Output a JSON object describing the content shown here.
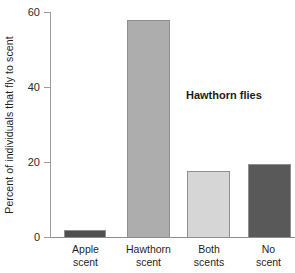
{
  "chart_data": {
    "type": "bar",
    "title": "",
    "subtitle": "",
    "xlabel": "",
    "ylabel": "Percent of individuals that fly to scent",
    "ylim": [
      0,
      60
    ],
    "yticks": [
      0,
      20,
      40,
      60
    ],
    "ytick_labels": [
      "0",
      "20",
      "40",
      "60"
    ],
    "grid": false,
    "legend": null,
    "annotations": [
      {
        "text": "Hawthorn flies",
        "bold": true
      }
    ],
    "categories": [
      "Apple\nscent",
      "Hawthorn\nscent",
      "Both\nscents",
      "No\nscent"
    ],
    "category_lines": [
      [
        "Apple",
        "scent"
      ],
      [
        "Hawthorn",
        "scent"
      ],
      [
        "Both",
        "scents"
      ],
      [
        "No",
        "scent"
      ]
    ],
    "values": [
      2,
      58,
      17.5,
      19.5
    ],
    "bar_colors": [
      "#4f4f4f",
      "#adadad",
      "#d6d6d6",
      "#595959"
    ],
    "bar_border_color": "#8f8f8f",
    "axis_color": "#9a9a9a",
    "text_color": "#1f1f1f"
  },
  "labels": {
    "y_axis_title": "Percent of individuals that fly to scent",
    "ytick_0": "0",
    "ytick_1": "20",
    "ytick_2": "40",
    "ytick_3": "60",
    "cat_0_line_0": "Apple",
    "cat_0_line_1": "scent",
    "cat_1_line_0": "Hawthorn",
    "cat_1_line_1": "scent",
    "cat_2_line_0": "Both",
    "cat_2_line_1": "scents",
    "cat_3_line_0": "No",
    "cat_3_line_1": "scent",
    "annotation": "Hawthorn flies"
  }
}
